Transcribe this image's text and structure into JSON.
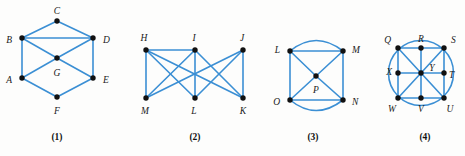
{
  "figure": {
    "background_color": "#fdfdfc",
    "edge_color": "#3b8fd4",
    "vertex_color": "#111111",
    "width": 465,
    "height": 156
  },
  "graphs": [
    {
      "caption": "(1)",
      "caption_pos": {
        "x": 57,
        "y": 140
      },
      "vertices": [
        {
          "id": "C",
          "label": "C",
          "x": 57,
          "y": 21,
          "label_x": 57,
          "label_y": 12,
          "anchor": "middle"
        },
        {
          "id": "B",
          "label": "B",
          "x": 22,
          "y": 38,
          "label_x": 12,
          "label_y": 41,
          "anchor": "end"
        },
        {
          "id": "D",
          "label": "D",
          "x": 93,
          "y": 38,
          "label_x": 103,
          "label_y": 41,
          "anchor": "start"
        },
        {
          "id": "G",
          "label": "G",
          "x": 57,
          "y": 58,
          "label_x": 57,
          "label_y": 74,
          "anchor": "middle"
        },
        {
          "id": "A",
          "label": "A",
          "x": 22,
          "y": 78,
          "label_x": 12,
          "label_y": 81,
          "anchor": "end"
        },
        {
          "id": "E",
          "label": "E",
          "x": 93,
          "y": 78,
          "label_x": 103,
          "label_y": 81,
          "anchor": "start"
        },
        {
          "id": "F",
          "label": "F",
          "x": 57,
          "y": 97,
          "label_x": 57,
          "label_y": 112,
          "anchor": "middle"
        }
      ],
      "edges": [
        {
          "from": "B",
          "to": "C"
        },
        {
          "from": "C",
          "to": "D"
        },
        {
          "from": "B",
          "to": "D"
        },
        {
          "from": "B",
          "to": "G"
        },
        {
          "from": "G",
          "to": "D"
        },
        {
          "from": "B",
          "to": "A"
        },
        {
          "from": "D",
          "to": "E"
        },
        {
          "from": "A",
          "to": "G"
        },
        {
          "from": "G",
          "to": "E"
        },
        {
          "from": "A",
          "to": "F"
        },
        {
          "from": "F",
          "to": "E"
        }
      ],
      "arcs": []
    },
    {
      "caption": "(2)",
      "caption_pos": {
        "x": 195,
        "y": 140
      },
      "vertices": [
        {
          "id": "H",
          "label": "H",
          "x": 146,
          "y": 50,
          "label_x": 144,
          "label_y": 39,
          "anchor": "middle"
        },
        {
          "id": "I",
          "label": "I",
          "x": 195,
          "y": 50,
          "label_x": 194,
          "label_y": 39,
          "anchor": "middle"
        },
        {
          "id": "J",
          "label": "J",
          "x": 243,
          "y": 50,
          "label_x": 242,
          "label_y": 39,
          "anchor": "middle"
        },
        {
          "id": "M",
          "label": "M",
          "x": 146,
          "y": 98,
          "label_x": 145,
          "label_y": 112,
          "anchor": "middle"
        },
        {
          "id": "L",
          "label": "L",
          "x": 195,
          "y": 98,
          "label_x": 194,
          "label_y": 112,
          "anchor": "middle"
        },
        {
          "id": "K",
          "label": "K",
          "x": 243,
          "y": 98,
          "label_x": 243,
          "label_y": 112,
          "anchor": "middle"
        }
      ],
      "edges": [
        {
          "from": "H",
          "to": "I"
        },
        {
          "from": "H",
          "to": "M"
        },
        {
          "from": "H",
          "to": "L"
        },
        {
          "from": "H",
          "to": "K"
        },
        {
          "from": "I",
          "to": "M"
        },
        {
          "from": "I",
          "to": "L"
        },
        {
          "from": "I",
          "to": "K"
        },
        {
          "from": "J",
          "to": "M"
        },
        {
          "from": "J",
          "to": "L"
        },
        {
          "from": "J",
          "to": "K"
        }
      ],
      "arcs": []
    },
    {
      "caption": "(3)",
      "caption_pos": {
        "x": 313,
        "y": 140
      },
      "vertices": [
        {
          "id": "L3",
          "label": "L",
          "x": 290,
          "y": 51,
          "label_x": 280,
          "label_y": 51,
          "anchor": "end"
        },
        {
          "id": "M3",
          "label": "M",
          "x": 343,
          "y": 51,
          "label_x": 352,
          "label_y": 51,
          "anchor": "start"
        },
        {
          "id": "P",
          "label": "P",
          "x": 316,
          "y": 76,
          "label_x": 316,
          "label_y": 91,
          "anchor": "middle"
        },
        {
          "id": "O",
          "label": "O",
          "x": 290,
          "y": 100,
          "label_x": 280,
          "label_y": 103,
          "anchor": "end"
        },
        {
          "id": "N",
          "label": "N",
          "x": 343,
          "y": 100,
          "label_x": 352,
          "label_y": 103,
          "anchor": "start"
        }
      ],
      "edges": [
        {
          "from": "L3",
          "to": "M3"
        },
        {
          "from": "L3",
          "to": "O"
        },
        {
          "from": "M3",
          "to": "N"
        },
        {
          "from": "O",
          "to": "N"
        },
        {
          "from": "L3",
          "to": "P"
        },
        {
          "from": "P",
          "to": "N"
        },
        {
          "from": "M3",
          "to": "P"
        },
        {
          "from": "P",
          "to": "O"
        }
      ],
      "arcs": [
        {
          "from": "L3",
          "to": "M3",
          "label": "top-arc",
          "d": "M 290 51 Q 316 30 343 51"
        },
        {
          "from": "O",
          "to": "N",
          "label": "bottom-arc",
          "d": "M 290 100 Q 316 121 343 100"
        }
      ]
    },
    {
      "caption": "(4)",
      "caption_pos": {
        "x": 425,
        "y": 140
      },
      "vertices": [
        {
          "id": "Q",
          "label": "Q",
          "x": 398,
          "y": 48,
          "label_x": 391,
          "label_y": 41,
          "anchor": "end"
        },
        {
          "id": "R",
          "label": "R",
          "x": 421,
          "y": 48,
          "label_x": 421,
          "label_y": 40,
          "anchor": "middle"
        },
        {
          "id": "S",
          "label": "S",
          "x": 444,
          "y": 48,
          "label_x": 451,
          "label_y": 41,
          "anchor": "start"
        },
        {
          "id": "X",
          "label": "X",
          "x": 398,
          "y": 73,
          "label_x": 392,
          "label_y": 73,
          "anchor": "end"
        },
        {
          "id": "Y",
          "label": "Y",
          "x": 421,
          "y": 73,
          "label_x": 432,
          "label_y": 69,
          "anchor": "middle"
        },
        {
          "id": "T",
          "label": "T",
          "x": 444,
          "y": 73,
          "label_x": 449,
          "label_y": 76,
          "anchor": "start"
        },
        {
          "id": "W",
          "label": "W",
          "x": 398,
          "y": 98,
          "label_x": 392,
          "label_y": 110,
          "anchor": "middle"
        },
        {
          "id": "V",
          "label": "V",
          "x": 421,
          "y": 98,
          "label_x": 421,
          "label_y": 110,
          "anchor": "middle"
        },
        {
          "id": "U",
          "label": "U",
          "x": 444,
          "y": 98,
          "label_x": 450,
          "label_y": 110,
          "anchor": "middle"
        }
      ],
      "edges": [
        {
          "from": "Q",
          "to": "R"
        },
        {
          "from": "R",
          "to": "S"
        },
        {
          "from": "X",
          "to": "Y"
        },
        {
          "from": "Y",
          "to": "T"
        },
        {
          "from": "W",
          "to": "V"
        },
        {
          "from": "V",
          "to": "U"
        },
        {
          "from": "Q",
          "to": "X"
        },
        {
          "from": "X",
          "to": "W"
        },
        {
          "from": "R",
          "to": "Y"
        },
        {
          "from": "Y",
          "to": "V"
        },
        {
          "from": "S",
          "to": "T"
        },
        {
          "from": "T",
          "to": "U"
        },
        {
          "from": "Q",
          "to": "Y"
        },
        {
          "from": "Y",
          "to": "U"
        },
        {
          "from": "S",
          "to": "Y"
        },
        {
          "from": "Y",
          "to": "W"
        }
      ],
      "arcs": [
        {
          "from": "circle",
          "to": "circle",
          "label": "circumscribed-circle",
          "d": "M 421 73 m -32.5 0 a 32.5 32.5 0 1 0 65 0 a 32.5 32.5 0 1 0 -65 0"
        }
      ]
    }
  ]
}
